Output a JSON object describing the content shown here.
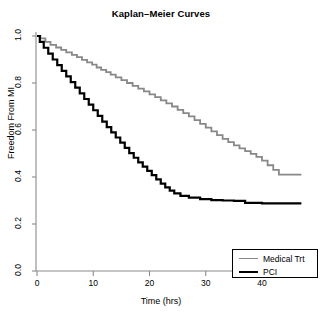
{
  "chart_data": {
    "type": "line",
    "title": "Kaplan–Meier Curves",
    "xlabel": "Time (hrs)",
    "ylabel": "Freedom From MI",
    "xlim": [
      0,
      47
    ],
    "ylim": [
      0.0,
      1.0
    ],
    "xticks": [
      0,
      10,
      20,
      30,
      40
    ],
    "xtick_labels": [
      "0",
      "10",
      "20",
      "30",
      "40"
    ],
    "yticks": [
      0.0,
      0.2,
      0.4,
      0.6,
      0.8,
      1.0
    ],
    "ytick_labels": [
      "0.0",
      "0.2",
      "0.4",
      "0.6",
      "0.8",
      "1.0"
    ],
    "grid": false,
    "step_style": "post",
    "legend_position": "bottom-right",
    "series": [
      {
        "name": "Medical Trt",
        "color": "#888888",
        "linewidth": 1.8,
        "x": [
          0,
          0.6,
          1.5,
          2.4,
          3.4,
          4.3,
          5.2,
          6.2,
          7.1,
          8.0,
          8.9,
          9.8,
          10.6,
          11.4,
          12.3,
          13.1,
          14.0,
          15.0,
          16.0,
          17.0,
          18.0,
          19.0,
          20.0,
          21.0,
          22.0,
          23.0,
          24.0,
          25.0,
          26.0,
          27.0,
          28.0,
          29.0,
          30.0,
          31.0,
          32.0,
          33.0,
          34.0,
          35.0,
          36.0,
          37.0,
          38.0,
          39.0,
          40.0,
          41.0,
          42.0,
          43.0,
          47.0
        ],
        "y": [
          1.0,
          0.99,
          0.975,
          0.962,
          0.951,
          0.941,
          0.93,
          0.92,
          0.91,
          0.898,
          0.888,
          0.878,
          0.866,
          0.856,
          0.846,
          0.836,
          0.824,
          0.812,
          0.8,
          0.788,
          0.776,
          0.764,
          0.752,
          0.74,
          0.726,
          0.713,
          0.7,
          0.686,
          0.672,
          0.658,
          0.642,
          0.626,
          0.61,
          0.594,
          0.578,
          0.562,
          0.548,
          0.535,
          0.522,
          0.51,
          0.498,
          0.486,
          0.47,
          0.45,
          0.43,
          0.41,
          0.41
        ]
      },
      {
        "name": "PCI",
        "color": "#000000",
        "linewidth": 2.2,
        "x": [
          0,
          0.5,
          1.2,
          2.0,
          2.8,
          3.6,
          4.4,
          5.2,
          6.0,
          6.8,
          7.6,
          8.4,
          9.2,
          10.0,
          10.8,
          11.6,
          12.4,
          13.2,
          14.0,
          14.8,
          15.6,
          16.4,
          17.2,
          18.0,
          18.8,
          19.6,
          20.4,
          21.2,
          22.0,
          22.8,
          23.6,
          24.4,
          25.5,
          27.0,
          29.0,
          31.0,
          33.0,
          35.0,
          37.0,
          40.0,
          43.0,
          47.0
        ],
        "y": [
          1.0,
          0.975,
          0.95,
          0.925,
          0.9,
          0.876,
          0.852,
          0.828,
          0.804,
          0.78,
          0.756,
          0.732,
          0.708,
          0.684,
          0.66,
          0.636,
          0.612,
          0.59,
          0.568,
          0.546,
          0.524,
          0.502,
          0.482,
          0.462,
          0.444,
          0.426,
          0.408,
          0.39,
          0.372,
          0.356,
          0.342,
          0.33,
          0.32,
          0.312,
          0.306,
          0.302,
          0.3,
          0.298,
          0.29,
          0.288,
          0.288,
          0.288
        ]
      }
    ]
  },
  "legend": {
    "entries": [
      {
        "label": "Medical Trt",
        "color": "#888888",
        "width": 1.8
      },
      {
        "label": "PCI",
        "color": "#000000",
        "width": 2.2
      }
    ]
  }
}
